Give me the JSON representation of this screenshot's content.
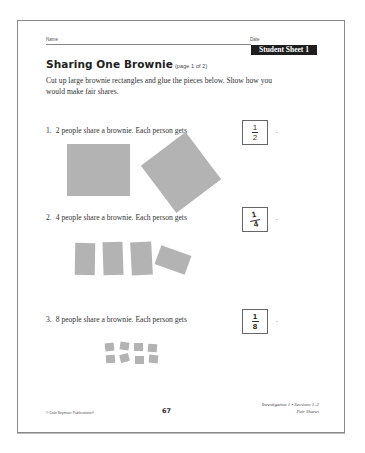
{
  "header": {
    "name_label": "Name",
    "date_label": "Date",
    "badge": "Student Sheet 1"
  },
  "title": {
    "main": "Sharing One Brownie",
    "sub": "(page 1 of 2)"
  },
  "instructions": "Cut up large brownie rectangles and glue the pieces below. Show how you would make fair shares.",
  "questions": [
    {
      "number": "1.",
      "text": "2 people share a brownie. Each person gets",
      "answer": {
        "numerator": "1",
        "denominator": "2",
        "handwritten": false
      },
      "period": ".",
      "pieces": 2
    },
    {
      "number": "2.",
      "text": "4 people share a brownie. Each person gets",
      "answer": {
        "numerator": "1",
        "denominator": "4",
        "handwritten": true
      },
      "period": ".",
      "pieces": 4
    },
    {
      "number": "3.",
      "text": "8 people share a brownie. Each person gets",
      "answer": {
        "numerator": "1",
        "denominator": "8",
        "handwritten": true
      },
      "period": ".",
      "pieces": 8
    }
  ],
  "footer": {
    "copyright": "© Dale Seymour Publications®",
    "page_number": "67",
    "investigation": "Investigation 1 • Sessions 1–2",
    "unit": "Fair Shares"
  },
  "colors": {
    "brownie_piece": "#b3b3b3",
    "badge_bg": "#1e1e1e",
    "text": "#333333"
  }
}
